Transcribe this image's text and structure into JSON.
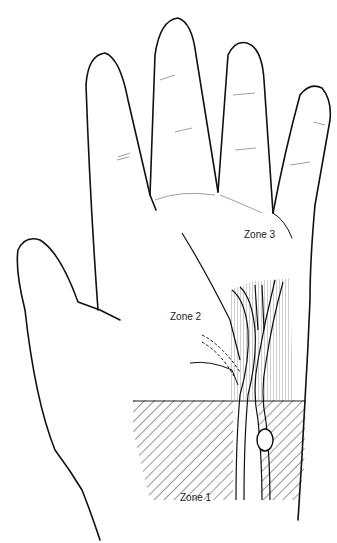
{
  "figure": {
    "labels": {
      "zone1": "Zone 1",
      "zone2": "Zone 2",
      "zone3": "Zone 3"
    },
    "colors": {
      "outline": "#111111",
      "hatch": "#333333",
      "background": "#ffffff"
    }
  }
}
